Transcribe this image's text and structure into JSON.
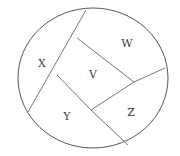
{
  "figure": {
    "type": "geometry-diagram",
    "canvas": {
      "width": 180,
      "height": 156
    },
    "background_color": "#ffffff",
    "outline_color": "#555555",
    "chord_color": "#767676",
    "label_color": "#3c3c3c",
    "outline": {
      "shape": "ellipse",
      "center_x": 93,
      "center_y": 78,
      "radius_x": 75,
      "radius_y": 70
    },
    "vertices": {
      "top_on_circle": {
        "x": 86,
        "y": 10
      },
      "upper_center": {
        "x": 77,
        "y": 38
      },
      "left_center": {
        "x": 57,
        "y": 75
      },
      "lower_left_on_circle": {
        "x": 28,
        "y": 112
      },
      "bottom_center": {
        "x": 91,
        "y": 110
      },
      "right_center": {
        "x": 134,
        "y": 82
      },
      "right_on_circle": {
        "x": 165,
        "y": 68
      },
      "bottom_on_circle": {
        "x": 128,
        "y": 145
      }
    },
    "chords": [
      {
        "name": "top-to-lower-left",
        "from": "top_on_circle",
        "to": "lower_left_on_circle"
      },
      {
        "name": "upper-center-to-right-center",
        "from": "upper_center",
        "to": "right_center"
      },
      {
        "name": "left-center-to-bottom-center",
        "from": "left_center",
        "to": "bottom_center"
      },
      {
        "name": "bottom-center-to-right-center",
        "from": "bottom_center",
        "to": "right_center"
      },
      {
        "name": "right-center-to-right-edge",
        "from": "right_center",
        "to": "right_on_circle"
      },
      {
        "name": "bottom-center-to-bottom-edge",
        "from": "bottom_center",
        "to": "bottom_on_circle"
      }
    ],
    "regions": [
      {
        "id": "X",
        "label": "X",
        "label_x": 42,
        "label_y": 64,
        "position": "left"
      },
      {
        "id": "W",
        "label": "W",
        "label_x": 127,
        "label_y": 44,
        "position": "upper-right"
      },
      {
        "id": "V",
        "label": "V",
        "label_x": 93,
        "label_y": 75,
        "position": "center"
      },
      {
        "id": "Y",
        "label": "Y",
        "label_x": 67,
        "label_y": 117,
        "position": "lower-left"
      },
      {
        "id": "Z",
        "label": "Z",
        "label_x": 131,
        "label_y": 113,
        "position": "lower-right"
      }
    ]
  }
}
